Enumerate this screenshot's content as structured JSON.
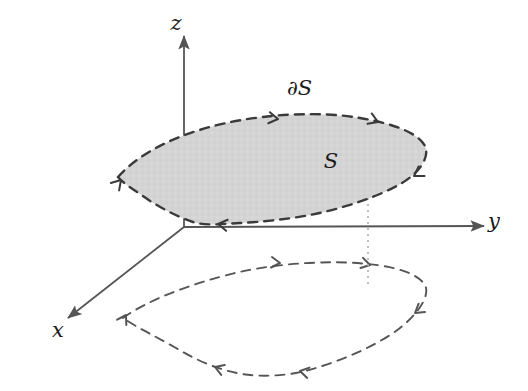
{
  "figure": {
    "background_color": "#ffffff",
    "axes": {
      "stroke_color": "#555555",
      "x": {
        "label": "x",
        "label_x": 58,
        "label_y": 337,
        "from_x": 184,
        "from_y": 227,
        "to_x": 68,
        "to_y": 318
      },
      "y": {
        "label": "y",
        "label_x": 494,
        "label_y": 228,
        "from_x": 184,
        "from_y": 227,
        "to_x": 484,
        "to_y": 226
      },
      "z": {
        "label": "z",
        "label_x": 176,
        "label_y": 30,
        "from_x": 184,
        "from_y": 227,
        "to_x": 184,
        "to_y": 36
      }
    },
    "surface": {
      "label": "S",
      "label_x": 331,
      "label_y": 168,
      "fill_color": "#d4d4d4",
      "boundary_label": "∂S",
      "boundary_label_x": 287,
      "boundary_label_y": 95,
      "boundary_stroke_color": "#3a3a3a",
      "boundary_dash": "9,7",
      "path": "M 118 177 C 140 152, 180 133, 226 123 C 268 114, 320 111, 360 118 C 395 124, 418 133, 425 146 C 430 157, 420 172, 402 183 C 380 196, 345 208, 310 215 C 288 219, 262 222, 240 223 C 222 224, 205 226, 193 222 C 175 216, 155 205, 140 194 C 128 186, 121 181, 118 177 Z"
    },
    "projection_curve": {
      "stroke_color": "#555555",
      "dash": "9,7",
      "path": "M 123 318 C 148 300, 190 284, 235 273 C 278 263, 330 260, 368 264 C 398 267, 418 274, 425 285 C 430 295, 420 312, 400 328 C 378 345, 340 362, 305 371 C 285 376, 262 377, 242 374 C 218 370, 196 360, 176 348 C 155 336, 136 327, 123 318 Z"
    },
    "dotted_connector": {
      "stroke_color": "#b0b0b0",
      "dash": "2,4",
      "from_x": 368,
      "from_y": 186,
      "to_x": 368,
      "to_y": 286
    },
    "orientation_arrows": {
      "stroke_color": "#3a3a3a",
      "boundary": [
        {
          "x": 278,
          "y": 119,
          "angle": 8
        },
        {
          "x": 378,
          "y": 122,
          "angle": 22
        },
        {
          "x": 414,
          "y": 176,
          "angle": 148
        },
        {
          "x": 218,
          "y": 224,
          "angle": 188
        },
        {
          "x": 121,
          "y": 180,
          "angle": 312
        }
      ],
      "projection": [
        {
          "x": 280,
          "y": 263,
          "angle": 5
        },
        {
          "x": 370,
          "y": 265,
          "angle": 14
        },
        {
          "x": 415,
          "y": 313,
          "angle": 143
        },
        {
          "x": 300,
          "y": 371,
          "angle": 192
        },
        {
          "x": 215,
          "y": 367,
          "angle": 200
        },
        {
          "x": 126,
          "y": 315,
          "angle": 300
        }
      ]
    }
  }
}
